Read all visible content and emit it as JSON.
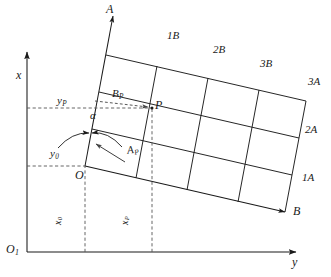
{
  "figure": {
    "type": "geometric-coordinate-diagram",
    "background": "#ffffff",
    "stroke_color": "#1a1a1a",
    "dash_color": "#555555"
  },
  "axes": {
    "reference_origin_label": "O",
    "reference_origin_sub": "1",
    "vertical_axis_label": "x",
    "horizontal_axis_label": "y",
    "grid_origin_label": "O",
    "grid_axis_a_label": "A",
    "grid_axis_b_label": "B",
    "rotation_angle_label": "α"
  },
  "point": {
    "label": "P",
    "coord_a_label": "A",
    "coord_a_sub": "P",
    "coord_b_label": "B",
    "coord_b_sub": "P",
    "offset_x_label": "x",
    "offset_x_sub": "P",
    "offset_y_label": "y",
    "offset_y_sub": "P"
  },
  "origin_offsets": {
    "x_label": "x",
    "x_sub": "0",
    "y_label": "y",
    "y_sub": "0"
  },
  "grid_labels": {
    "top_edge": [
      {
        "text": "1B",
        "x": 167,
        "y": 30
      },
      {
        "text": "2B",
        "x": 213,
        "y": 44
      },
      {
        "text": "3B",
        "x": 260,
        "y": 58
      }
    ],
    "right_edge": [
      {
        "text": "3A",
        "x": 308,
        "y": 76
      },
      {
        "text": "2A",
        "x": 305,
        "y": 124
      },
      {
        "text": "1A",
        "x": 302,
        "y": 172
      }
    ]
  }
}
